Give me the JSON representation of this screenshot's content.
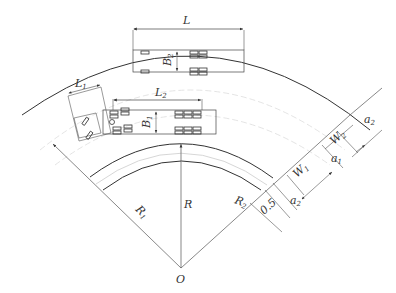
{
  "diagram": {
    "type": "curved road widening schematic",
    "labels": {
      "L": "L",
      "L1": "L",
      "L1_sub": "1",
      "L2": "L",
      "L2_sub": "2",
      "B1": "B",
      "B1_sub": "1",
      "B2": "B",
      "B2_sub": "2",
      "R": "R",
      "R1": "R",
      "R1_sub": "1",
      "R2": "R",
      "R2_sub": "2",
      "O": "O",
      "W1": "W",
      "W1_sub": "1",
      "W2": "W",
      "W2_sub": "2",
      "a1": "a",
      "a1_sub": "1",
      "a2_outer": "a",
      "a2_outer_sub": "2",
      "a2_inner": "a",
      "a2_inner_sub": "2",
      "offset": "0.5"
    },
    "colors": {
      "line": "#333333",
      "thin": "#666666",
      "dashed": "#cccccc",
      "background": "#ffffff"
    }
  }
}
